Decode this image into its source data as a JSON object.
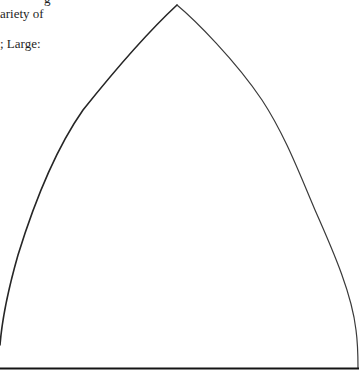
{
  "document": {
    "text_lines": [
      "g",
      "ariety of",
      "",
      "; Large:"
    ]
  },
  "figure": {
    "shape": "gothic-arch-template",
    "stroke_color": "#2a2a2a",
    "base_color": "#1a1a1a",
    "apex": [
      177,
      5
    ],
    "base_left": [
      0,
      368
    ],
    "base_right": [
      358,
      368
    ]
  }
}
